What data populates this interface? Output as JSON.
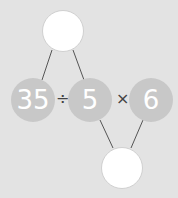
{
  "expression": {
    "operands": [
      "35",
      "5",
      "6"
    ],
    "operators": [
      "÷",
      "×"
    ]
  },
  "answer_bubbles": {
    "top": "",
    "bottom": ""
  },
  "colors": {
    "background": "#e3e3e3",
    "number_circle": "#c8c8c8",
    "answer_circle": "#ffffff",
    "line": "#555555"
  }
}
